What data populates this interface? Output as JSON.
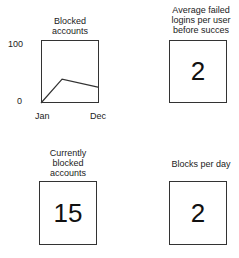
{
  "panels": {
    "blocked_chart": {
      "title": "Blocked accounts"
    },
    "avg_failed": {
      "title": "Average failed logins per user before succes",
      "value": "2"
    },
    "currently_blocked": {
      "title": "Currently blocked accounts",
      "value": "15"
    },
    "blocks_per_day": {
      "title": "Blocks per day",
      "value": "2"
    }
  },
  "chart_data": {
    "type": "line",
    "title": "Blocked accounts",
    "xlabel": "",
    "ylabel": "",
    "x_tick_labels": [
      "Jan",
      "Dec"
    ],
    "y_tick_labels": [
      "100",
      "0"
    ],
    "ylim": [
      0,
      100
    ],
    "x": [
      1,
      5,
      12
    ],
    "series": [
      {
        "name": "Blocked accounts",
        "values": [
          0,
          38,
          25
        ]
      }
    ],
    "grid": false,
    "legend": "none"
  }
}
